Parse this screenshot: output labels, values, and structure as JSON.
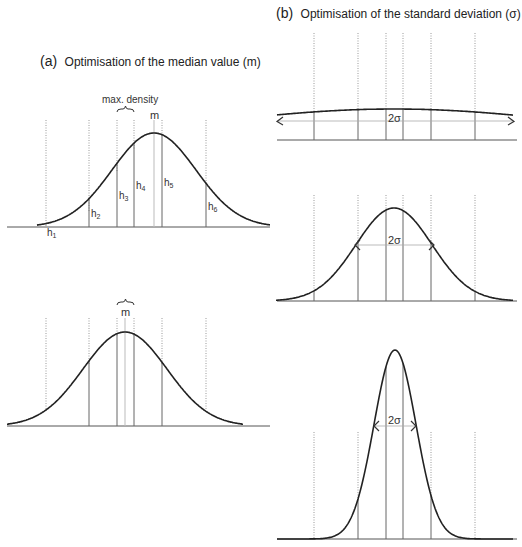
{
  "panel_a": {
    "title_prefix": "(a)",
    "title_text": "Optimisation of the median value (m)",
    "top": {
      "max_density_label": "max. density",
      "median_label": "m",
      "heights": [
        {
          "label": "h",
          "sub": "1"
        },
        {
          "label": "h",
          "sub": "2"
        },
        {
          "label": "h",
          "sub": "3"
        },
        {
          "label": "h",
          "sub": "4"
        },
        {
          "label": "h",
          "sub": "5"
        },
        {
          "label": "h",
          "sub": "6"
        }
      ]
    },
    "bottom": {
      "median_label": "m"
    }
  },
  "panel_b": {
    "title_prefix": "(b)",
    "title_text": "Optimisation of the standard deviation (σ)",
    "width_label": "2σ",
    "plots": [
      {
        "name": "wide",
        "sigma_relative": "large"
      },
      {
        "name": "medium",
        "sigma_relative": "medium"
      },
      {
        "name": "narrow",
        "sigma_relative": "small"
      }
    ]
  }
}
